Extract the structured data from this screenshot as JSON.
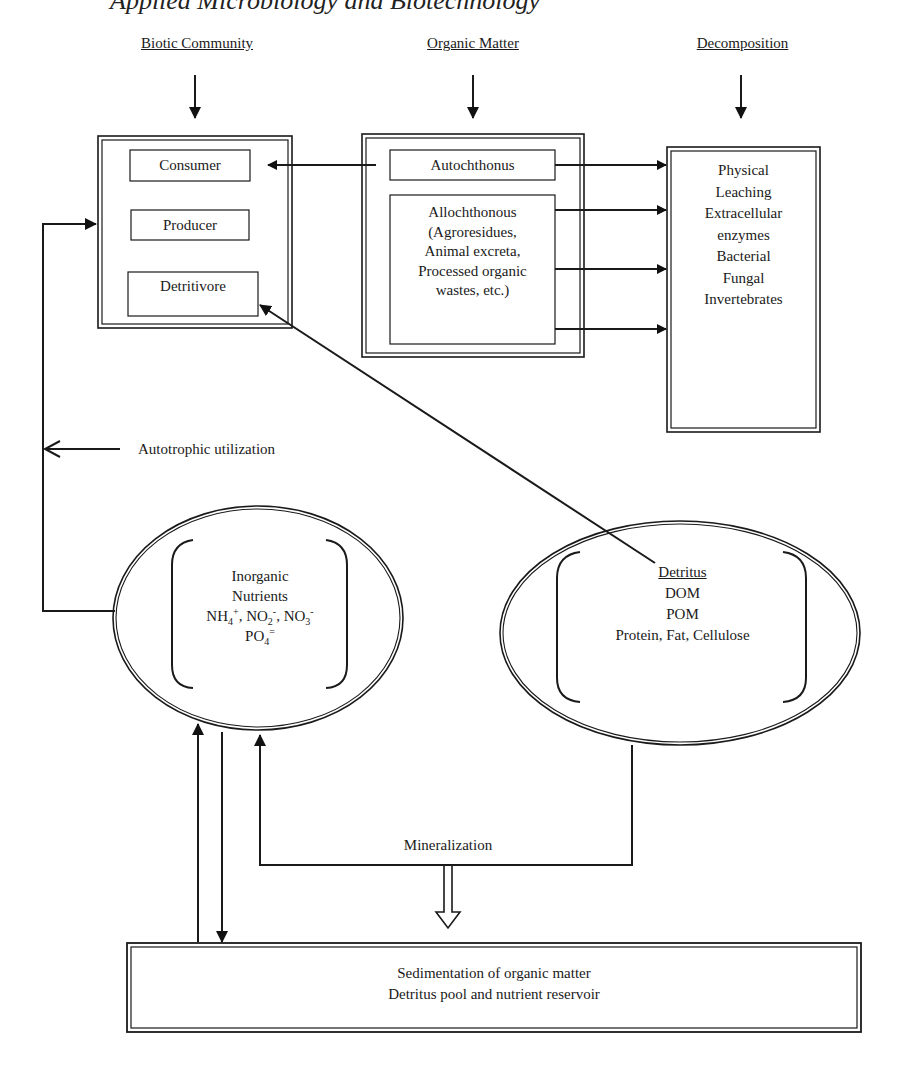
{
  "page_header": "Applied Microbiology and Biotechnology",
  "columns": {
    "biotic": "Biotic Community",
    "organic": "Organic Matter",
    "decomposition": "Decomposition"
  },
  "biotic_box": {
    "items": [
      "Consumer",
      "Producer",
      "Detritivore"
    ]
  },
  "organic_box": {
    "autochthonus": "Autochthonus",
    "allochthonous_lines": [
      "Allochthonous",
      "(Agroresidues,",
      "Animal excreta,",
      "Processed organic",
      "wastes, etc.)"
    ]
  },
  "decomposition_box": {
    "lines": [
      "Physical",
      "Leaching",
      "Extracellular",
      "enzymes",
      "Bacterial",
      "Fungal",
      "Invertebrates"
    ]
  },
  "autotrophic_label": "Autotrophic utilization",
  "inorganic": {
    "line1": "Inorganic",
    "line2": "Nutrients",
    "nh4": "NH",
    "nh4_sub": "4",
    "nh4_sup": "+",
    "no2": "NO",
    "no2_sub": "2",
    "no2_sup": "-",
    "no3": "NO",
    "no3_sub": "3",
    "no3_sup": "-",
    "po4": "PO",
    "po4_sub": "4",
    "po4_sup": "="
  },
  "detritus": {
    "title": "Detritus",
    "lines": [
      "DOM",
      "POM",
      "Protein, Fat, Cellulose"
    ]
  },
  "mineralization_label": "Mineralization",
  "sediment_box": {
    "lines": [
      "Sedimentation of organic matter",
      "Detritus pool and nutrient reservoir"
    ]
  }
}
